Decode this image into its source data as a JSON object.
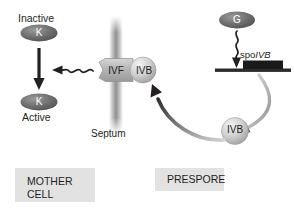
{
  "diagram": {
    "compartments": [
      {
        "name": "mother-cell",
        "label": "MOTHER\nCELL",
        "line1": "MOTHER",
        "line2": "CELL"
      },
      {
        "name": "prespore",
        "label": "PRESPORE",
        "line1": "PRESPORE",
        "line2": ""
      }
    ],
    "structures": {
      "septum_label": "Septum",
      "gene_label_prefix": "spo",
      "gene_label_italic": "IVB",
      "gene_label_full": "spoIVB"
    },
    "nodes": [
      {
        "name": "sigma-k-inactive",
        "symbol": "K",
        "state_label": "Inactive",
        "shape": "ellipse",
        "fill": "#6e6e6e",
        "text_color": "#ffffff"
      },
      {
        "name": "sigma-k-active",
        "symbol": "K",
        "state_label": "Active",
        "shape": "ellipse",
        "fill": "#6e6e6e",
        "text_color": "#ffffff"
      },
      {
        "name": "sigma-g",
        "symbol": "G",
        "state_label": "",
        "shape": "ellipse",
        "fill": "#6e6e6e",
        "text_color": "#ffffff"
      },
      {
        "name": "spoivf-complex",
        "symbol": "IVF",
        "state_label": "",
        "shape": "hexagon",
        "fill": "#b3b3b3",
        "text_color": "#231f20"
      },
      {
        "name": "spoivb-at-septum",
        "symbol": "IVB",
        "state_label": "",
        "shape": "circle",
        "fill": "#c9c9c9",
        "text_color": "#231f20"
      },
      {
        "name": "spoivb-in-prespore",
        "symbol": "IVB",
        "state_label": "",
        "shape": "circle",
        "fill": "#cfcfcf",
        "text_color": "#231f20"
      }
    ],
    "arrows": [
      {
        "name": "activation-arrow-k",
        "style": "straight",
        "color": "#231f20",
        "from": "sigma-k-inactive",
        "to": "sigma-k-active"
      },
      {
        "name": "signal-wavy-arrow-ivf-to-k",
        "style": "wavy",
        "color": "#231f20",
        "from": "spoivf-complex",
        "to": "activation-arrow-k"
      },
      {
        "name": "transcription-wavy-arrow-g",
        "style": "wavy",
        "color": "#231f20",
        "from": "sigma-g",
        "to": "spoIVB-gene"
      },
      {
        "name": "secretion-arrow-gene-to-ivb",
        "style": "curved",
        "color": "#a6a6a6",
        "from": "spoIVB-gene",
        "to": "spoivb-in-prespore"
      },
      {
        "name": "translocation-arrow-ivb-to-septum",
        "style": "curved",
        "color": "#3a3a3a",
        "from": "spoivb-in-prespore",
        "to": "spoivb-at-septum"
      }
    ],
    "colors": {
      "background": "#ffffff",
      "septum": "#9d9d9d",
      "compartment_box": "#e2e2e2",
      "gene_box": "#1a1a1a",
      "dna_line": "#2b2b2b",
      "text": "#231f20"
    }
  }
}
